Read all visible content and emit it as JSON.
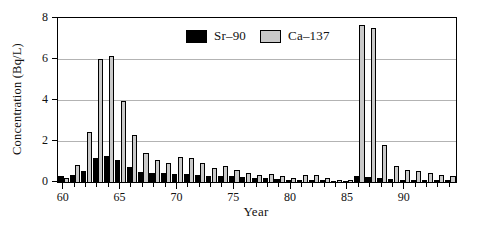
{
  "figure": {
    "background": "#ffffff",
    "text_color": "#111111",
    "gridline_color": "#b3b3b3"
  },
  "chart_data": {
    "type": "bar",
    "title": "",
    "xlabel": "Year",
    "ylabel": "Concentration (Bq/L)",
    "categories": [
      60,
      61,
      62,
      63,
      64,
      65,
      66,
      67,
      68,
      69,
      70,
      71,
      72,
      73,
      74,
      75,
      76,
      77,
      78,
      79,
      80,
      81,
      82,
      83,
      84,
      85,
      86,
      87,
      88,
      89,
      90,
      91,
      92,
      93,
      94
    ],
    "series": [
      {
        "name": "Sr–90",
        "color": "#000000",
        "values": [
          0.3,
          0.35,
          0.55,
          1.15,
          1.25,
          1.05,
          0.75,
          0.5,
          0.45,
          0.45,
          0.4,
          0.4,
          0.35,
          0.3,
          0.3,
          0.3,
          0.25,
          0.2,
          0.2,
          0.15,
          0.12,
          0.12,
          0.1,
          0.1,
          0.07,
          0.07,
          0.3,
          0.25,
          0.2,
          0.15,
          0.12,
          0.1,
          0.1,
          0.08,
          0.1
        ]
      },
      {
        "name": "Ca–137",
        "color": "#c9c9c9",
        "values": [
          0.2,
          0.85,
          2.45,
          6.0,
          6.15,
          3.95,
          2.3,
          1.4,
          1.05,
          0.95,
          1.2,
          1.15,
          0.95,
          0.7,
          0.8,
          0.6,
          0.45,
          0.33,
          0.4,
          0.3,
          0.22,
          0.35,
          0.33,
          0.22,
          0.12,
          0.1,
          7.65,
          7.5,
          1.8,
          0.8,
          0.6,
          0.55,
          0.45,
          0.35,
          0.3
        ]
      }
    ],
    "ylim": [
      0,
      8
    ],
    "yticks": [
      0,
      2,
      4,
      6,
      8
    ],
    "gridlines_at": [
      2,
      4,
      6
    ],
    "xticks_labeled": [
      60,
      65,
      70,
      75,
      80,
      85,
      90
    ],
    "grid": "horizontal",
    "legend_position": "top-center"
  }
}
